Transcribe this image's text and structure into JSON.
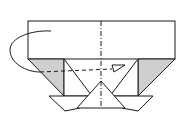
{
  "diagram": {
    "type": "origami-fold-step",
    "description": "Fold the left half behind along the center valley line",
    "colors": {
      "line": "#1a1a1a",
      "paper": "#ffffff",
      "shade": "#cfcfcf"
    },
    "elements": {
      "top_panel": "rectangle",
      "center_line": "dash-dot mountain/valley crease",
      "left_shaded_flap": "gray triangle",
      "right_shaded_flap": "gray triangle",
      "center_triangle": "white triangle",
      "bottom_left_flap": "white flap",
      "bottom_right_flap": "white flap",
      "fold_arrow": "curved arrow behind",
      "fold_path": "dashed line with hollow arrowhead"
    }
  }
}
